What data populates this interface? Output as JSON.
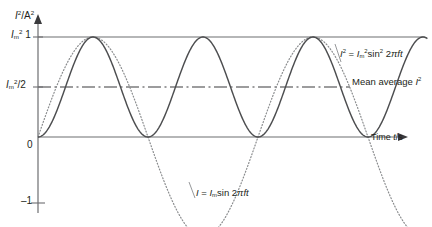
{
  "figure": {
    "background": "#ffffff",
    "ink_color": "#58595b",
    "text_color": "#231f20"
  },
  "axes": {
    "y_axis_label": "I²/A²",
    "x_axis_label": "Time t/s",
    "y_ticks": [
      {
        "value": 1,
        "label": "Iₘ² 1"
      },
      {
        "value": 0.5,
        "label": "Iₘ²/2"
      },
      {
        "value": 0,
        "label": "0"
      },
      {
        "value": -1,
        "label": "−1"
      }
    ],
    "x_ticks": []
  },
  "annotations": {
    "curve_isq_label": "I² = Iₘ²sin² 2πft",
    "mean_line_label": "Mean average I²",
    "curve_i_label": "I = Iₘsin 2πft"
  },
  "chart_data": {
    "type": "line",
    "title": "",
    "xlabel": "Time t/s",
    "ylabel": "I²/A²",
    "xlim": [
      0,
      3.3
    ],
    "ylim": [
      -1.15,
      1.15
    ],
    "grid": false,
    "legend": "inline-annotations",
    "x_unit": "periods of I (T = 1/f)",
    "series": [
      {
        "name": "I² = Iₘ²sin² 2πft",
        "style": "solid",
        "color": "#58595b",
        "function": "sin(2*pi*f*t)^2",
        "amplitude": 1,
        "offset": 0,
        "period_in_plot_units": 0.5,
        "min": 0,
        "max": 1,
        "mean": 0.5,
        "sample_x": [
          0,
          0.125,
          0.25,
          0.375,
          0.5,
          0.625,
          0.75,
          0.875,
          1.0,
          1.25,
          1.5,
          1.75,
          2.0,
          2.25,
          2.5,
          2.75,
          3.0,
          3.25
        ],
        "sample_y": [
          0,
          0.5,
          1,
          0.5,
          0,
          0.5,
          1,
          0.5,
          0,
          1,
          0,
          1,
          0,
          1,
          0,
          1,
          0,
          1
        ]
      },
      {
        "name": "I = Iₘsin 2πft",
        "style": "dotted",
        "color": "#8a8c8e",
        "function": "sin(2*pi*f*t)",
        "amplitude": 1,
        "offset": 0,
        "period_in_plot_units": 1.0,
        "min": -1,
        "max": 1,
        "mean": 0,
        "sample_x": [
          0,
          0.25,
          0.5,
          0.75,
          1.0,
          1.25,
          1.5,
          1.75,
          2.0,
          2.25,
          2.5,
          2.75,
          3.0,
          3.25
        ],
        "sample_y": [
          0,
          1,
          0,
          -1,
          0,
          1,
          0,
          -1,
          0,
          1,
          0,
          -1,
          0,
          1
        ]
      }
    ],
    "reference_lines": [
      {
        "name": "peak-line",
        "orientation": "horizontal",
        "value": 1,
        "style": "solid",
        "label": "Iₘ² 1"
      },
      {
        "name": "mean-line",
        "orientation": "horizontal",
        "value": 0.5,
        "style": "dash-dot",
        "label": "Mean average I²"
      }
    ]
  }
}
